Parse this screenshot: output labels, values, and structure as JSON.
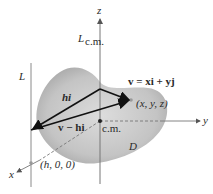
{
  "diagram": {
    "labels": {
      "z_axis": "z",
      "y_axis": "y",
      "x_axis": "x",
      "line_cm": "L",
      "line_cm_sub": "c.m.",
      "line_L": "L",
      "hi": "hi",
      "v_eq": "v = xi + yj",
      "point": "(x, y, z)",
      "v_minus_hi": "v − hi",
      "cm": "c.m.",
      "region": "D",
      "h_point": "(h, 0, 0)"
    },
    "colors": {
      "blob_center": "#d8d8d8",
      "blob_edge": "#a8a8a8",
      "axis": "#777777",
      "vector": "#1a1a1a",
      "background": "#ffffff"
    }
  }
}
